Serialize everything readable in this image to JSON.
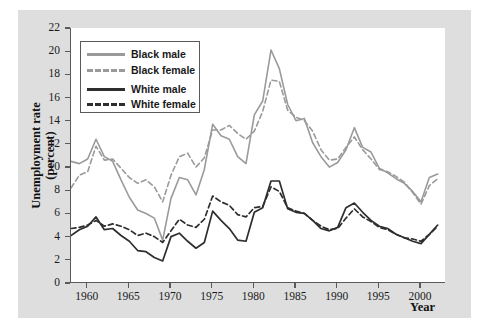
{
  "figure": {
    "panel_bg": "#dedede",
    "plot_bg": "#ffffff",
    "axis_color": "#5a5a5a"
  },
  "axes": {
    "ylabel_line1": "Unemployment rate",
    "ylabel_line2": "(percent)",
    "xlabel": "Year",
    "yticks": [
      0,
      2,
      4,
      6,
      8,
      10,
      12,
      14,
      16,
      18,
      20,
      22
    ],
    "ytick_labels": [
      "0",
      "2",
      "4",
      "6",
      "8",
      "10",
      "12",
      "14",
      "16",
      "18",
      "20",
      "22"
    ],
    "xticks": [
      1960,
      1965,
      1970,
      1975,
      1980,
      1985,
      1990,
      1995,
      2000
    ],
    "xtick_labels": [
      "1960",
      "1965",
      "1970",
      "1975",
      "1980",
      "1985",
      "1990",
      "1995",
      "2000"
    ]
  },
  "legend": {
    "position": "upper-left-inside",
    "entries": [
      {
        "label": "Black male",
        "color": "#9a9a9a",
        "dash": false
      },
      {
        "label": "Black female",
        "color": "#9a9a9a",
        "dash": true
      },
      {
        "label": "White male",
        "color": "#2e2e2e",
        "dash": false
      },
      {
        "label": "White female",
        "color": "#2e2e2e",
        "dash": true
      }
    ]
  },
  "chart_data": {
    "type": "line",
    "title": "",
    "subtitle": "",
    "xlabel": "Year",
    "ylabel": "Unemployment rate (percent)",
    "xlim": [
      1958,
      2003
    ],
    "ylim": [
      0,
      22
    ],
    "grid": false,
    "legend_position": "upper-left-inside",
    "x": [
      1958,
      1959,
      1960,
      1961,
      1962,
      1963,
      1964,
      1965,
      1966,
      1967,
      1968,
      1969,
      1970,
      1971,
      1972,
      1973,
      1974,
      1975,
      1976,
      1977,
      1978,
      1979,
      1980,
      1981,
      1982,
      1983,
      1984,
      1985,
      1986,
      1987,
      1988,
      1989,
      1990,
      1991,
      1992,
      1993,
      1994,
      1995,
      1996,
      1997,
      1998,
      1999,
      2000,
      2001,
      2002
    ],
    "series": [
      {
        "name": "Black male",
        "color": "#9a9a9a",
        "dash": false,
        "values": [
          10.5,
          10.3,
          10.7,
          12.4,
          10.9,
          10.5,
          8.9,
          7.4,
          6.3,
          6.0,
          5.6,
          3.7,
          7.3,
          9.1,
          8.9,
          7.6,
          9.8,
          13.7,
          12.7,
          12.4,
          10.9,
          10.3,
          14.5,
          15.7,
          20.1,
          18.5,
          15.4,
          14.0,
          14.2,
          12.1,
          10.9,
          10.0,
          10.4,
          11.5,
          13.4,
          11.7,
          11.3,
          9.9,
          9.5,
          9.0,
          8.6,
          7.9,
          7.0,
          9.1,
          9.4
        ]
      },
      {
        "name": "Black female",
        "color": "#9a9a9a",
        "dash": true,
        "values": [
          8.2,
          9.3,
          9.6,
          11.8,
          10.6,
          10.7,
          9.9,
          9.1,
          8.6,
          8.9,
          8.3,
          7.0,
          9.3,
          10.9,
          11.2,
          10.0,
          10.8,
          13.2,
          13.2,
          13.6,
          12.9,
          12.4,
          13.1,
          14.8,
          17.5,
          17.4,
          14.9,
          14.3,
          14.0,
          13.1,
          11.5,
          10.6,
          10.7,
          11.7,
          12.6,
          11.5,
          10.7,
          9.8,
          9.6,
          9.2,
          8.7,
          7.8,
          6.8,
          8.4,
          9.0
        ]
      },
      {
        "name": "White male",
        "color": "#2e2e2e",
        "dash": false,
        "values": [
          4.1,
          4.6,
          4.9,
          5.7,
          4.6,
          4.7,
          4.1,
          3.6,
          2.8,
          2.7,
          2.2,
          1.9,
          4.0,
          4.3,
          3.6,
          3.0,
          3.5,
          6.2,
          5.4,
          4.7,
          3.7,
          3.6,
          6.1,
          6.5,
          8.8,
          8.8,
          6.4,
          6.1,
          6.0,
          5.4,
          4.7,
          4.5,
          4.8,
          6.5,
          6.9,
          6.1,
          5.4,
          4.9,
          4.7,
          4.2,
          3.9,
          3.6,
          3.4,
          4.2,
          5.0
        ]
      },
      {
        "name": "White female",
        "color": "#2e2e2e",
        "dash": true,
        "values": [
          4.7,
          4.8,
          5.0,
          5.4,
          4.9,
          5.1,
          4.9,
          4.6,
          4.1,
          4.3,
          4.0,
          3.5,
          4.5,
          5.5,
          5.0,
          4.8,
          5.5,
          7.5,
          7.0,
          6.7,
          5.9,
          5.7,
          6.5,
          6.6,
          8.3,
          7.9,
          6.5,
          6.2,
          6.0,
          5.4,
          4.9,
          4.6,
          4.7,
          5.6,
          6.4,
          5.7,
          5.3,
          4.8,
          4.6,
          4.2,
          3.9,
          3.8,
          3.6,
          4.2,
          4.9
        ]
      }
    ]
  }
}
